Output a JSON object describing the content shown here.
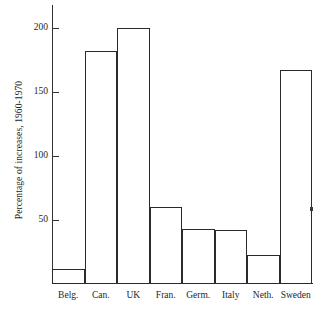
{
  "chart_data": {
    "type": "bar",
    "title": "",
    "xlabel": "",
    "ylabel": "Percentage of increases, 1960-1970",
    "categories": [
      "Belg.",
      "Can.",
      "UK",
      "Fran.",
      "Germ.",
      "Italy",
      "Neth.",
      "Sweden"
    ],
    "values": [
      12,
      182,
      200,
      60,
      43,
      42,
      23,
      167
    ],
    "ylim": [
      0,
      218
    ],
    "yticks": [
      50,
      100,
      150,
      200
    ],
    "ytick_labels": [
      "50",
      "100",
      "150",
      "200"
    ],
    "grid": false,
    "legend": null,
    "bar_fill": "#ffffff",
    "bar_stroke": "#2b2b2b",
    "axis_color": "#333333",
    "background": "#ffffff"
  }
}
